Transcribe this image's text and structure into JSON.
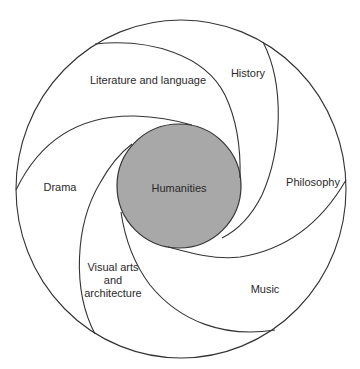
{
  "diagram": {
    "center": {
      "label": "Humanities",
      "fill": "#a8a8a8"
    },
    "segments": [
      {
        "id": "literature",
        "label": "Literature and language"
      },
      {
        "id": "history",
        "label": "History"
      },
      {
        "id": "philosophy",
        "label": "Philosophy"
      },
      {
        "id": "music",
        "label": "Music"
      },
      {
        "id": "visual-arts",
        "label": "Visual arts and architecture"
      },
      {
        "id": "drama",
        "label": "Drama"
      }
    ],
    "line_color": "#333333"
  }
}
